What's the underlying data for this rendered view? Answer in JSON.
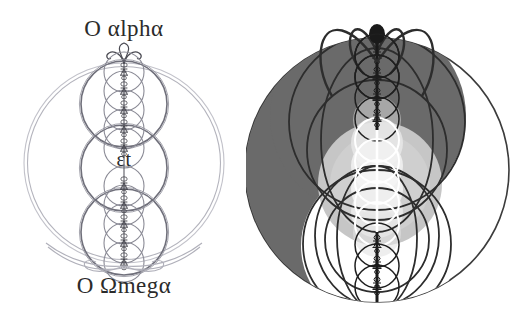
{
  "page": {
    "background_color": "#ffffff",
    "width": 514,
    "height": 326
  },
  "left_figure": {
    "name": "alpha-omega-circle-diagram",
    "labels": {
      "top": "O αlphα",
      "middle": "εt",
      "bottom": "O Ωmegα"
    },
    "colors": {
      "outline_light": "#b9b9c2",
      "outline_medium": "#6f6f7a",
      "outline_dark": "#3a3a42",
      "text": "#2b2b2b"
    },
    "geometry": {
      "outer_circle": {
        "cx": 124,
        "cy": 163,
        "r": 100
      },
      "outer_circle_inner": {
        "cx": 124,
        "cy": 163,
        "r": 96
      },
      "medium_circles": [
        {
          "cx": 124,
          "cy": 104,
          "r": 43
        },
        {
          "cx": 124,
          "cy": 168,
          "r": 43
        },
        {
          "cx": 124,
          "cy": 232,
          "r": 43
        }
      ],
      "small_circle_radius": 20,
      "small_circle_count": 11,
      "small_circle_top_cy": 72,
      "small_circle_spacing": 19,
      "axis_x": 124,
      "top_curl_y": 52,
      "bottom_ribbon_y": 266
    }
  },
  "right_figure": {
    "name": "yin-yang-circle-diagram",
    "colors": {
      "dark_fill": "#6a6a6a",
      "mid_fill": "#a8a8a8",
      "light_fill": "#c9c9c9",
      "white_fill": "#ffffff",
      "outline_dark": "#2d2d2d",
      "outline_medium": "#555555"
    },
    "geometry": {
      "main_circle": {
        "cx": 131,
        "cy": 170,
        "r": 132
      },
      "dark_half": "left",
      "upper_dark_disc": {
        "cx": 120,
        "cy": 118,
        "r": 96
      },
      "lower_white_disc": {
        "cx": 133,
        "cy": 245,
        "r": 76
      },
      "light_gray_disc": {
        "cx": 134,
        "cy": 183,
        "r": 62
      },
      "axis_x": 131,
      "small_circle_radius": 22,
      "small_circle_count": 11,
      "small_circle_top_cy": 56,
      "small_circle_spacing": 21,
      "antenna_arc_count": 4
    }
  }
}
